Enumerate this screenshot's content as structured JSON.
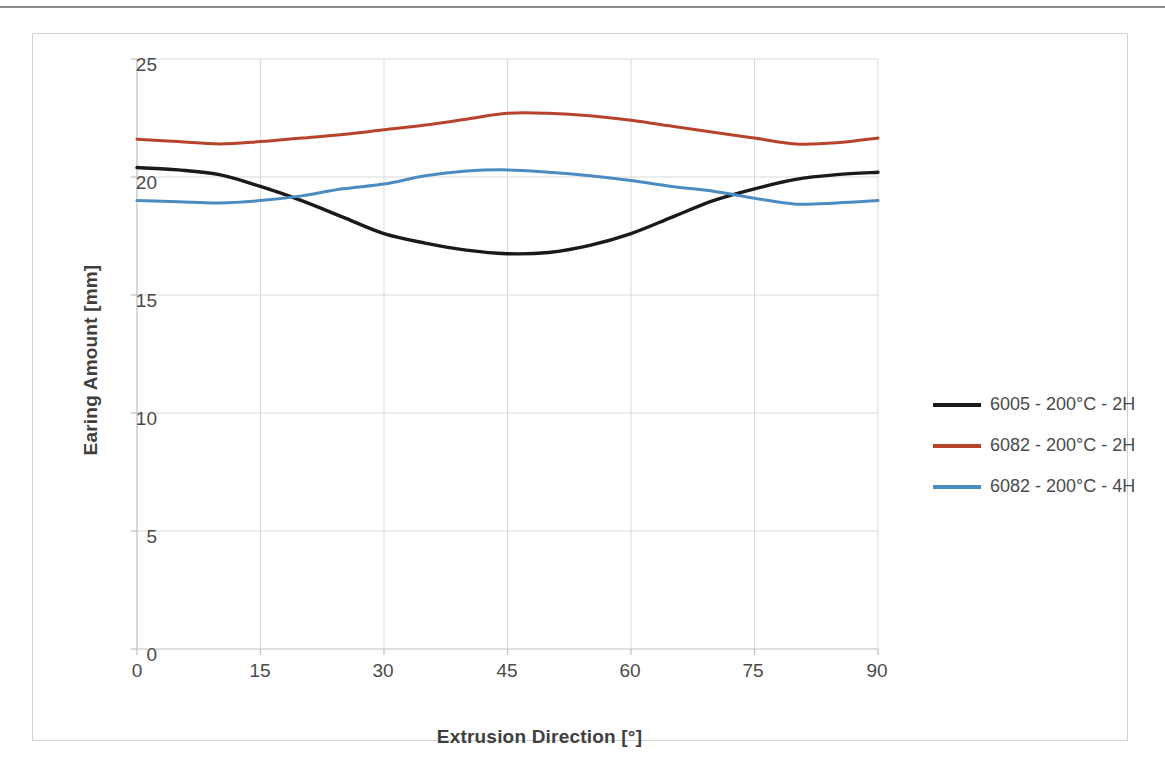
{
  "chart_data": {
    "type": "line",
    "title": "",
    "xlabel": "Extrusion Direction [°]",
    "ylabel": "Earing Amount [mm]",
    "xlim": [
      0,
      90
    ],
    "ylim": [
      0,
      25
    ],
    "xticks": [
      "0",
      "15",
      "30",
      "45",
      "60",
      "75",
      "90"
    ],
    "yticks": [
      "0",
      "5",
      "10",
      "15",
      "20",
      "25"
    ],
    "grid": true,
    "legend_position": "right",
    "x": [
      0,
      5,
      10,
      15,
      20,
      25,
      30,
      35,
      40,
      45,
      50,
      55,
      60,
      65,
      70,
      75,
      80,
      85,
      90
    ],
    "series": [
      {
        "name": "6005 - 200°C - 2H",
        "color": "#1a1a1a",
        "values": [
          20.4,
          20.3,
          20.1,
          19.6,
          19.0,
          18.3,
          17.6,
          17.2,
          16.9,
          16.75,
          16.8,
          17.1,
          17.6,
          18.3,
          19.0,
          19.5,
          19.9,
          20.1,
          20.2
        ]
      },
      {
        "name": "6082 - 200°C - 2H",
        "color": "#b8432c",
        "values": [
          21.6,
          21.5,
          21.4,
          21.5,
          21.65,
          21.8,
          22.0,
          22.2,
          22.45,
          22.7,
          22.7,
          22.6,
          22.4,
          22.15,
          21.9,
          21.65,
          21.4,
          21.45,
          21.65
        ]
      },
      {
        "name": "6082 - 200°C - 4H",
        "color": "#4a8cc2",
        "values": [
          19.0,
          18.95,
          18.9,
          19.0,
          19.2,
          19.5,
          19.7,
          20.05,
          20.25,
          20.3,
          20.2,
          20.05,
          19.85,
          19.6,
          19.4,
          19.1,
          18.85,
          18.9,
          19.0
        ]
      }
    ]
  },
  "axes": {
    "x_title": "Extrusion Direction [°]",
    "y_title": "Earing Amount [mm]"
  },
  "legend": {
    "items": [
      {
        "label": "6005 - 200°C - 2H",
        "color": "#1a1a1a"
      },
      {
        "label": "6082 - 200°C - 2H",
        "color": "#b8432c"
      },
      {
        "label": "6082 - 200°C - 4H",
        "color": "#4a8cc2"
      }
    ]
  },
  "colors": {
    "grid": "#d9d9d9",
    "axis": "#bfbfbf",
    "frame": "#d0d0d0",
    "text": "#4a4a4a",
    "title_text": "#3f3f3f"
  }
}
